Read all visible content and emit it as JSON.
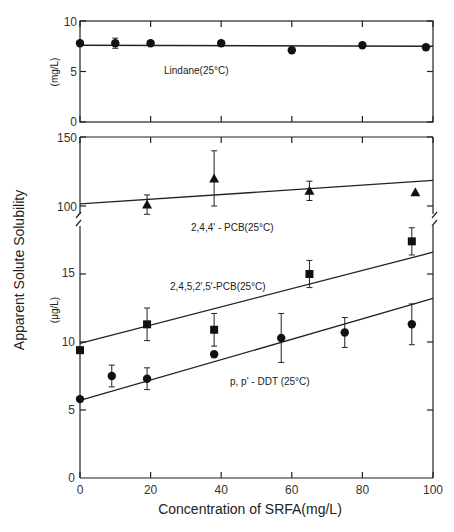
{
  "chart_data": {
    "type": "scatter",
    "title": "",
    "xlabel": "Concentration of SRFA(mg/L)",
    "ylabel": "Apparent Solute Solubility",
    "xlim": [
      0,
      100
    ],
    "x_ticks": [
      "0",
      "20",
      "40",
      "60",
      "80",
      "100"
    ],
    "grid": false,
    "legend": "inline labels",
    "panels": [
      {
        "name": "top",
        "unit": "(mg/L)",
        "ylim": [
          0,
          10
        ],
        "y_ticks": [
          "0",
          "5",
          "10"
        ],
        "series": [
          {
            "name": "Lindane(25°C)",
            "marker": "circle",
            "points": [
              {
                "x": 0,
                "y": 7.8
              },
              {
                "x": 10,
                "y": 7.8,
                "err": 0.5
              },
              {
                "x": 20,
                "y": 7.8
              },
              {
                "x": 40,
                "y": 7.8
              },
              {
                "x": 60,
                "y": 7.1
              },
              {
                "x": 80,
                "y": 7.6
              },
              {
                "x": 98,
                "y": 7.4
              }
            ],
            "fit": {
              "x0": 0,
              "y0": 7.6,
              "x1": 100,
              "y1": 7.5
            }
          }
        ]
      },
      {
        "name": "middle",
        "unit": "",
        "ylim": [
          100,
          150
        ],
        "y_ticks": [
          "100",
          "150"
        ],
        "series": [
          {
            "name": "2,4,4'-PCB(25°C)",
            "marker": "triangle",
            "points": [
              {
                "x": 19,
                "y": 101,
                "err": 7
              },
              {
                "x": 38,
                "y": 120,
                "err": 20
              },
              {
                "x": 65,
                "y": 111,
                "err": 7
              },
              {
                "x": 95,
                "y": 110
              }
            ],
            "fit": {
              "x0": 0,
              "y0": 101.5,
              "x1": 100,
              "y1": 118.5
            }
          }
        ]
      },
      {
        "name": "bottom",
        "unit": "(μg/L)",
        "ylim": [
          0,
          18
        ],
        "y_ticks": [
          "0",
          "5",
          "10",
          "15"
        ],
        "series": [
          {
            "name": "2,4,5,2',5'-PCB(25°C)",
            "marker": "square",
            "points": [
              {
                "x": 0,
                "y": 9.4
              },
              {
                "x": 19,
                "y": 11.3,
                "err": 1.2
              },
              {
                "x": 38,
                "y": 10.9,
                "err": 1.2
              },
              {
                "x": 65,
                "y": 15.0,
                "err": 1.0
              },
              {
                "x": 94,
                "y": 17.4,
                "err": 1.0
              }
            ],
            "fit": {
              "x0": 0,
              "y0": 9.9,
              "x1": 100,
              "y1": 16.6
            }
          },
          {
            "name": "p,p'-DDT (25°C)",
            "marker": "circle",
            "points": [
              {
                "x": 0,
                "y": 5.8
              },
              {
                "x": 9,
                "y": 7.5,
                "err": 0.8
              },
              {
                "x": 19,
                "y": 7.3,
                "err": 0.8
              },
              {
                "x": 38,
                "y": 9.1
              },
              {
                "x": 57,
                "y": 10.3,
                "err": 1.8
              },
              {
                "x": 75,
                "y": 10.7,
                "err": 1.1
              },
              {
                "x": 94,
                "y": 11.3,
                "err": 1.5
              }
            ],
            "fit": {
              "x0": 0,
              "y0": 5.7,
              "x1": 100,
              "y1": 13.2
            }
          }
        ]
      }
    ]
  },
  "labels": {
    "xlabel": "Concentration of SRFA(mg/L)",
    "ylabel": "Apparent Solute Solubility",
    "unit_top": "(mg/L)",
    "unit_bottom": "(μg/L)",
    "lindane": "Lindane(25°C)",
    "pcb244": "2,4,4' - PCB(25°C)",
    "pcb24525": "2,4,5,2',5'-PCB(25°C)",
    "ddt": "p, p' - DDT (25°C)"
  },
  "ticks": {
    "x": [
      "0",
      "20",
      "40",
      "60",
      "80",
      "100"
    ],
    "top": [
      "0",
      "5",
      "10"
    ],
    "middle": [
      "100",
      "150"
    ],
    "bottom": [
      "0",
      "5",
      "10",
      "15"
    ]
  }
}
